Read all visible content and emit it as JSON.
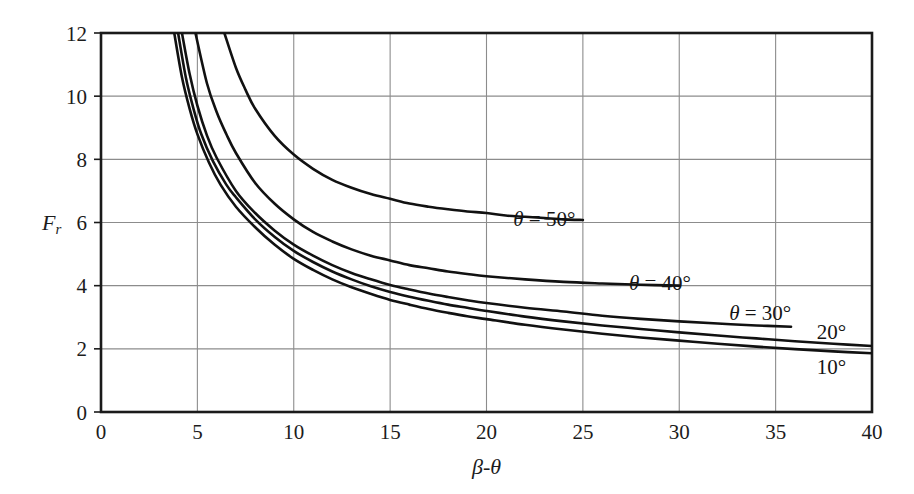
{
  "figure": {
    "background": "#ffffff",
    "line_color": "#111111",
    "grid_color": "#8c8c8c",
    "axis_color": "#1a1a1a"
  },
  "axes": {
    "x_title": "β-θ",
    "y_title": "Fr",
    "y_title_parts": {
      "main": "F",
      "sub": "r"
    },
    "x_ticks": [
      "0",
      "5",
      "10",
      "15",
      "20",
      "25",
      "30",
      "35",
      "40"
    ],
    "y_ticks": [
      "0",
      "2",
      "4",
      "6",
      "8",
      "10",
      "12"
    ],
    "x_min": 0,
    "x_max": 40,
    "y_min": 0,
    "y_max": 12,
    "x_step": 5,
    "y_step": 2,
    "grid": true
  },
  "chart_data": {
    "type": "line",
    "title": "",
    "xlabel": "β-θ",
    "ylabel": "Fr",
    "xlim": [
      0,
      40
    ],
    "ylim": [
      0,
      12
    ],
    "grid": true,
    "legend_position": "inline-end-of-curve",
    "series": [
      {
        "name": "θ = 50°",
        "theta_deg": 50,
        "label_text": "θ = 50°",
        "label_x": 23.0,
        "label_y": 6.1,
        "asymptote": 6.05,
        "points": [
          [
            6.4,
            12.0
          ],
          [
            7.0,
            10.9
          ],
          [
            7.5,
            10.2
          ],
          [
            8.0,
            9.6
          ],
          [
            9.0,
            8.75
          ],
          [
            10.0,
            8.15
          ],
          [
            11.0,
            7.7
          ],
          [
            12.0,
            7.35
          ],
          [
            13.0,
            7.1
          ],
          [
            14.0,
            6.9
          ],
          [
            15.0,
            6.75
          ],
          [
            16.0,
            6.6
          ],
          [
            17.0,
            6.5
          ],
          [
            18.0,
            6.42
          ],
          [
            19.0,
            6.35
          ],
          [
            20.0,
            6.3
          ],
          [
            21.0,
            6.22
          ],
          [
            22.0,
            6.18
          ],
          [
            23.0,
            6.14
          ],
          [
            24.0,
            6.1
          ],
          [
            25.0,
            6.08
          ]
        ]
      },
      {
        "name": "θ = 40°",
        "theta_deg": 40,
        "label_text": "θ = 40°",
        "label_x": 29.0,
        "label_y": 4.1,
        "asymptote": 3.98,
        "points": [
          [
            4.9,
            12.0
          ],
          [
            5.5,
            10.4
          ],
          [
            6.0,
            9.5
          ],
          [
            6.5,
            8.8
          ],
          [
            7.0,
            8.2
          ],
          [
            8.0,
            7.25
          ],
          [
            9.0,
            6.6
          ],
          [
            10.0,
            6.1
          ],
          [
            11.0,
            5.7
          ],
          [
            12.0,
            5.4
          ],
          [
            13.0,
            5.15
          ],
          [
            14.0,
            4.95
          ],
          [
            15.0,
            4.8
          ],
          [
            16.0,
            4.65
          ],
          [
            17.0,
            4.55
          ],
          [
            18.0,
            4.45
          ],
          [
            19.0,
            4.37
          ],
          [
            20.0,
            4.3
          ],
          [
            22.0,
            4.2
          ],
          [
            24.0,
            4.12
          ],
          [
            26.0,
            4.07
          ],
          [
            28.0,
            4.03
          ],
          [
            30.0,
            4.0
          ]
        ]
      },
      {
        "name": "θ = 30°",
        "theta_deg": 30,
        "label_text": "θ = 30°",
        "label_x": 34.2,
        "label_y": 3.15,
        "asymptote": 2.62,
        "points": [
          [
            4.2,
            12.0
          ],
          [
            4.6,
            10.7
          ],
          [
            5.0,
            9.7
          ],
          [
            5.5,
            8.75
          ],
          [
            6.0,
            8.05
          ],
          [
            7.0,
            7.0
          ],
          [
            8.0,
            6.3
          ],
          [
            9.0,
            5.75
          ],
          [
            10.0,
            5.3
          ],
          [
            11.0,
            4.95
          ],
          [
            12.0,
            4.65
          ],
          [
            13.0,
            4.4
          ],
          [
            14.0,
            4.2
          ],
          [
            15.0,
            4.02
          ],
          [
            16.0,
            3.88
          ],
          [
            17.0,
            3.75
          ],
          [
            18.0,
            3.64
          ],
          [
            19.0,
            3.54
          ],
          [
            20.0,
            3.45
          ],
          [
            22.0,
            3.3
          ],
          [
            24.0,
            3.18
          ],
          [
            26.0,
            3.05
          ],
          [
            28.0,
            2.95
          ],
          [
            30.0,
            2.87
          ],
          [
            32.0,
            2.8
          ],
          [
            34.0,
            2.74
          ],
          [
            35.8,
            2.7
          ]
        ]
      },
      {
        "name": "20°",
        "theta_deg": 20,
        "label_text": "20°",
        "label_x": 37.9,
        "label_y": 2.52,
        "asymptote": 2.08,
        "points": [
          [
            4.0,
            12.0
          ],
          [
            4.4,
            10.6
          ],
          [
            4.8,
            9.6
          ],
          [
            5.2,
            8.8
          ],
          [
            5.8,
            7.95
          ],
          [
            6.5,
            7.2
          ],
          [
            7.0,
            6.8
          ],
          [
            8.0,
            6.1
          ],
          [
            9.0,
            5.55
          ],
          [
            10.0,
            5.1
          ],
          [
            11.0,
            4.75
          ],
          [
            12.0,
            4.45
          ],
          [
            13.0,
            4.2
          ],
          [
            14.0,
            3.98
          ],
          [
            15.0,
            3.8
          ],
          [
            16.0,
            3.65
          ],
          [
            17.0,
            3.52
          ],
          [
            18.0,
            3.4
          ],
          [
            19.0,
            3.3
          ],
          [
            20.0,
            3.2
          ],
          [
            22.0,
            3.02
          ],
          [
            24.0,
            2.87
          ],
          [
            26.0,
            2.74
          ],
          [
            28.0,
            2.63
          ],
          [
            30.0,
            2.52
          ],
          [
            32.0,
            2.42
          ],
          [
            34.0,
            2.33
          ],
          [
            36.0,
            2.24
          ],
          [
            38.0,
            2.16
          ],
          [
            40.0,
            2.09
          ]
        ]
      },
      {
        "name": "10°",
        "theta_deg": 10,
        "label_text": "10°",
        "label_x": 37.9,
        "label_y": 1.42,
        "asymptote": 1.85,
        "points": [
          [
            3.8,
            12.0
          ],
          [
            4.2,
            10.6
          ],
          [
            4.6,
            9.6
          ],
          [
            5.0,
            8.8
          ],
          [
            5.6,
            7.9
          ],
          [
            6.2,
            7.2
          ],
          [
            7.0,
            6.5
          ],
          [
            8.0,
            5.85
          ],
          [
            9.0,
            5.3
          ],
          [
            10.0,
            4.85
          ],
          [
            11.0,
            4.5
          ],
          [
            12.0,
            4.2
          ],
          [
            13.0,
            3.95
          ],
          [
            14.0,
            3.74
          ],
          [
            15.0,
            3.55
          ],
          [
            16.0,
            3.4
          ],
          [
            17.0,
            3.26
          ],
          [
            18.0,
            3.14
          ],
          [
            19.0,
            3.03
          ],
          [
            20.0,
            2.94
          ],
          [
            22.0,
            2.76
          ],
          [
            24.0,
            2.61
          ],
          [
            26.0,
            2.48
          ],
          [
            28.0,
            2.36
          ],
          [
            30.0,
            2.26
          ],
          [
            32.0,
            2.16
          ],
          [
            34.0,
            2.07
          ],
          [
            36.0,
            1.99
          ],
          [
            38.0,
            1.92
          ],
          [
            40.0,
            1.86
          ]
        ]
      }
    ]
  }
}
